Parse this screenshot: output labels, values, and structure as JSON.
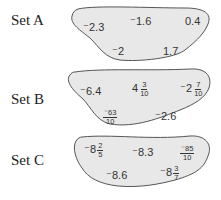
{
  "colors": {
    "blob_fill": "#e8e8e8",
    "blob_stroke": "#555555",
    "text": "#333333"
  },
  "sets": [
    {
      "label": "Set A",
      "values": [
        {
          "text": "⁻2.3"
        },
        {
          "text": "⁻1.6"
        },
        {
          "text": "0.4"
        },
        {
          "text": "⁻2"
        },
        {
          "text": "1.7"
        }
      ]
    },
    {
      "label": "Set B",
      "values": [
        {
          "text": "⁻6.4"
        },
        {
          "whole": "4",
          "num": "3",
          "den": "10"
        },
        {
          "whole": "⁻2",
          "num": "7",
          "den": "10"
        },
        {
          "sign": "⁻",
          "num": "63",
          "den": "10"
        },
        {
          "text": "⁻2.6"
        }
      ]
    },
    {
      "label": "Set C",
      "values": [
        {
          "whole": "⁻8",
          "num": "2",
          "den": "5"
        },
        {
          "text": "⁻8.3"
        },
        {
          "sign": "⁻",
          "num": "85",
          "den": "10"
        },
        {
          "text": "⁻8.6"
        },
        {
          "whole": "⁻8",
          "num": "3",
          "den": "7"
        }
      ]
    }
  ]
}
